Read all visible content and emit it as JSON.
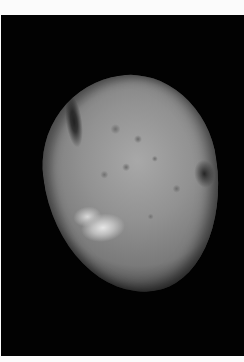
{
  "image": {
    "subject": "asteroid",
    "description": "Grayscale photograph of a cratered, potato-shaped asteroid against black space",
    "colors": {
      "border": "#fbfbfb",
      "space": "#020202",
      "surface_light": "#a8a8a8",
      "surface_dark": "#4a4a4a",
      "bright_crater": "#e6e6e6"
    }
  }
}
